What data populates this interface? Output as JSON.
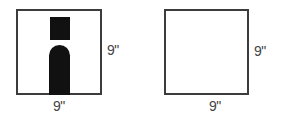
{
  "figures": [
    {
      "id": "left",
      "shape": "square",
      "contains": [
        "black-square",
        "black-arch"
      ],
      "dimensions": {
        "right": "9\"",
        "bottom": "9\""
      }
    },
    {
      "id": "right",
      "shape": "square",
      "contains": [],
      "dimensions": {
        "right": "9\"",
        "bottom": "9\""
      }
    }
  ],
  "colors": {
    "outline": "#3c3c3c",
    "fill": "#111111",
    "label": "#444444",
    "background": "#ffffff"
  }
}
